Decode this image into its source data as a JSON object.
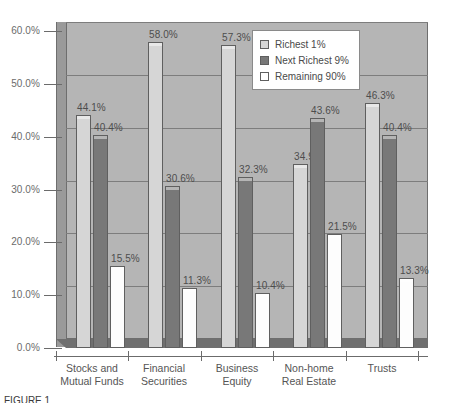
{
  "chart_data": {
    "type": "bar",
    "title": "",
    "subtitle": "",
    "xlabel": "",
    "ylabel": "",
    "ylim": [
      0,
      60
    ],
    "grid": true,
    "legend_position": "top-right",
    "ytick_labels": [
      "60.0%",
      "50.0%",
      "40.0%",
      "30.0%",
      "20.0%",
      "10.0%",
      "0.0%"
    ],
    "ytick_values": [
      60,
      50,
      40,
      30,
      20,
      10,
      0
    ],
    "categories": [
      "Stocks and\nMutual Funds",
      "Financial\nSecurities",
      "Business\nEquity",
      "Non-home\nReal Estate",
      "Trusts"
    ],
    "series": [
      {
        "name": "Richest 1%",
        "color": "#d6d6d6",
        "values": [
          44.1,
          58.0,
          57.3,
          34.9,
          46.3
        ],
        "labels": [
          "44.1%",
          "58.0%",
          "57.3%",
          "34.9%",
          "46.3%"
        ]
      },
      {
        "name": "Next Richest 9%",
        "color": "#787878",
        "values": [
          40.4,
          30.6,
          32.3,
          43.6,
          40.4
        ],
        "labels": [
          "40.4%",
          "30.6%",
          "32.3%",
          "43.6%",
          "40.4%"
        ]
      },
      {
        "name": "Remaining 90%",
        "color": "#ffffff",
        "values": [
          15.5,
          11.3,
          10.4,
          21.5,
          13.3
        ],
        "labels": [
          "15.5%",
          "11.3%",
          "10.4%",
          "21.5%",
          "13.3%"
        ]
      }
    ]
  },
  "legend": {
    "items": [
      {
        "label": "Richest 1%"
      },
      {
        "label": "Next Richest 9%"
      },
      {
        "label": "Remaining 90%"
      }
    ]
  },
  "caption": {
    "text": "FIGURE 1"
  }
}
